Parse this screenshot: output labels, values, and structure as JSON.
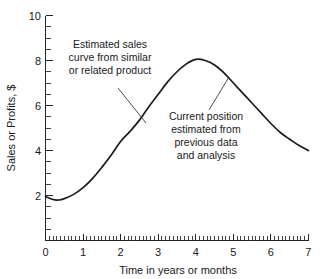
{
  "chart_data": {
    "type": "line",
    "title": "",
    "xlabel": "Time in years or months",
    "ylabel": "Sales or Profits, $",
    "xlim": [
      0,
      7
    ],
    "ylim": [
      0,
      10
    ],
    "grid": false,
    "legend": null,
    "x_ticks": [
      "0",
      "1",
      "2",
      "3",
      "4",
      "5",
      "6",
      "7"
    ],
    "y_ticks": [
      "2",
      "4",
      "6",
      "8",
      "10"
    ],
    "x_minor_per_major": 10,
    "y_minor_step": 0.5,
    "series": [
      {
        "name": "Estimated sales curve",
        "x": [
          0.0,
          0.2,
          0.35,
          0.5,
          0.75,
          1.0,
          1.25,
          1.5,
          1.75,
          2.0,
          2.25,
          2.5,
          2.75,
          3.0,
          3.25,
          3.5,
          3.75,
          4.0,
          4.25,
          4.5,
          4.75,
          5.0,
          5.25,
          5.5,
          5.75,
          6.0,
          6.25,
          6.5,
          6.75,
          7.0
        ],
        "y": [
          1.95,
          1.82,
          1.8,
          1.86,
          2.05,
          2.35,
          2.75,
          3.25,
          3.8,
          4.4,
          4.85,
          5.35,
          5.95,
          6.5,
          7.05,
          7.5,
          7.85,
          8.05,
          8.0,
          7.8,
          7.45,
          7.0,
          6.55,
          6.1,
          5.65,
          5.2,
          4.8,
          4.5,
          4.22,
          4.0
        ]
      }
    ],
    "annotations": [
      {
        "id": "annotation-estimated-curve",
        "lines": [
          "Estimated sales",
          "curve from similar",
          "or related product"
        ],
        "anchor_x": 2.45,
        "anchor_y": 5.05
      },
      {
        "id": "annotation-current-position",
        "lines": [
          "Current position",
          "estimated from",
          "previous data",
          "and analysis"
        ],
        "anchor_x": 4.62,
        "anchor_y": 7.25
      }
    ]
  },
  "axes": {
    "y_label": "Sales or Profits, $",
    "x_label": "Time in years or months",
    "y_tick_labels": [
      "10",
      "8",
      "6",
      "4",
      "2"
    ],
    "x_tick_labels": [
      "0",
      "1",
      "2",
      "3",
      "4",
      "5",
      "6",
      "7"
    ]
  },
  "annotations": {
    "estimated": {
      "line1": "Estimated sales",
      "line2": "curve from similar",
      "line3": "or related product"
    },
    "current": {
      "line1": "Current position",
      "line2": "estimated from",
      "line3": "previous data",
      "line4": "and analysis"
    }
  },
  "colors": {
    "curve": "#1b1b1b",
    "axis": "#232323",
    "text": "#1a1a1a",
    "background": "#ffffff"
  }
}
